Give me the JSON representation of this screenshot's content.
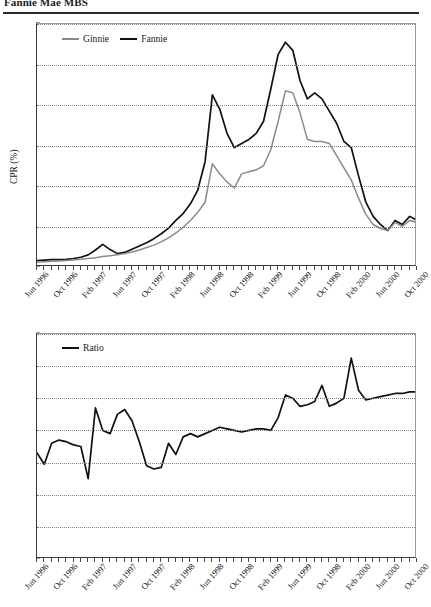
{
  "header": {
    "title": "Fannie Mae MBS"
  },
  "charts": [
    {
      "name": "cpr-chart",
      "legend": [
        {
          "label": "Ginnie",
          "color": "#8a8a8a"
        },
        {
          "label": "Fannie",
          "color": "#111111"
        }
      ],
      "ylabel": "CPR (%)",
      "yticks": [
        "0",
        "10",
        "20",
        "30",
        "40",
        "50",
        "60"
      ]
    },
    {
      "name": "ratio-chart",
      "legend": [
        {
          "label": "Ratio",
          "color": "#111111"
        }
      ],
      "ylabel": "",
      "yticks": [
        "0",
        "0.2",
        "0.4",
        "0.6",
        "0.8",
        "1.0",
        "1.2",
        "1.4"
      ]
    }
  ],
  "xlabels": [
    "Jun 1996",
    "Oct 1996",
    "Feb 1997",
    "Jun 1997",
    "Oct 1997",
    "Feb 1998",
    "Jun 1998",
    "Oct 1998",
    "Feb 1999",
    "Jun 1999",
    "Oct 1998",
    "Feb 2000",
    "Jun 2000",
    "Oct 2000"
  ],
  "chart_data": [
    {
      "type": "line",
      "name": "cpr-chart",
      "title": "",
      "xlabel": "",
      "ylabel": "CPR (%)",
      "ylim": [
        0,
        60
      ],
      "yticks": [
        0,
        10,
        20,
        30,
        40,
        50,
        60
      ],
      "grid": true,
      "legend_position": "top-left",
      "x": [
        "Jun 1996",
        "Jul 1996",
        "Aug 1996",
        "Sep 1996",
        "Oct 1996",
        "Nov 1996",
        "Dec 1996",
        "Jan 1997",
        "Feb 1997",
        "Mar 1997",
        "Apr 1997",
        "May 1997",
        "Jun 1997",
        "Jul 1997",
        "Aug 1997",
        "Sep 1997",
        "Oct 1997",
        "Nov 1997",
        "Dec 1997",
        "Jan 1998",
        "Feb 1998",
        "Mar 1998",
        "Apr 1998",
        "May 1998",
        "Jun 1998",
        "Jul 1998",
        "Aug 1998",
        "Sep 1998",
        "Oct 1998",
        "Nov 1998",
        "Dec 1998",
        "Jan 1999",
        "Feb 1999",
        "Mar 1999",
        "Apr 1999",
        "May 1999",
        "Jun 1999",
        "Jul 1999",
        "Aug 1999",
        "Sep 1999",
        "Oct 1999",
        "Nov 1999",
        "Dec 1999",
        "Jan 2000",
        "Feb 2000",
        "Mar 2000",
        "Apr 2000",
        "May 2000",
        "Jun 2000",
        "Jul 2000",
        "Aug 2000",
        "Sep 2000",
        "Oct 2000"
      ],
      "series": [
        {
          "name": "Fannie",
          "color": "#111111",
          "values": [
            1.6,
            1.7,
            1.8,
            1.8,
            1.9,
            2.1,
            2.4,
            3.0,
            4.2,
            5.6,
            4.3,
            3.3,
            3.6,
            4.4,
            5.2,
            6.0,
            7.0,
            8.2,
            9.6,
            11.5,
            13.2,
            15.6,
            19.0,
            26.0,
            42.5,
            39.0,
            33.0,
            29.5,
            30.5,
            31.5,
            33.0,
            36.0,
            44.0,
            52.5,
            55.5,
            53.5,
            46.0,
            41.5,
            43.0,
            41.5,
            38.5,
            35.5,
            31.0,
            29.5,
            22.5,
            16.0,
            12.5,
            10.5,
            9.0,
            11.5,
            10.5,
            12.5,
            11.5,
            12.0,
            12.0
          ]
        },
        {
          "name": "Ginnie",
          "color": "#8a8a8a",
          "values": [
            1.2,
            1.3,
            1.4,
            1.5,
            1.6,
            1.7,
            1.9,
            2.1,
            2.3,
            2.6,
            2.8,
            3.0,
            3.3,
            3.7,
            4.2,
            4.8,
            5.4,
            6.2,
            7.2,
            8.4,
            9.8,
            11.5,
            13.5,
            16.0,
            25.5,
            23.0,
            21.0,
            19.5,
            23.0,
            23.5,
            24.0,
            25.0,
            29.0,
            36.0,
            43.5,
            43.0,
            38.0,
            31.5,
            31.0,
            31.0,
            30.5,
            27.5,
            24.5,
            21.5,
            17.0,
            13.0,
            10.5,
            9.5,
            9.0,
            11.0,
            10.0,
            11.5,
            11.0,
            11.5,
            11.5
          ]
        }
      ]
    },
    {
      "type": "line",
      "name": "ratio-chart",
      "title": "",
      "xlabel": "",
      "ylabel": "",
      "ylim": [
        0,
        1.4
      ],
      "yticks": [
        0,
        0.2,
        0.4,
        0.6,
        0.8,
        1.0,
        1.2,
        1.4
      ],
      "grid": true,
      "legend_position": "top-left",
      "x": [
        "Jun 1996",
        "Jul 1996",
        "Aug 1996",
        "Sep 1996",
        "Oct 1996",
        "Nov 1996",
        "Dec 1996",
        "Jan 1997",
        "Feb 1997",
        "Mar 1997",
        "Apr 1997",
        "May 1997",
        "Jun 1997",
        "Jul 1997",
        "Aug 1997",
        "Sep 1997",
        "Oct 1997",
        "Nov 1997",
        "Dec 1997",
        "Jan 1998",
        "Feb 1998",
        "Mar 1998",
        "Apr 1998",
        "May 1998",
        "Jun 1998",
        "Jul 1998",
        "Aug 1998",
        "Sep 1998",
        "Oct 1998",
        "Nov 1998",
        "Dec 1998",
        "Jan 1999",
        "Feb 1999",
        "Mar 1999",
        "Apr 1999",
        "May 1999",
        "Jun 1999",
        "Jul 1999",
        "Aug 1999",
        "Sep 1999",
        "Oct 1999",
        "Nov 1999",
        "Dec 1999",
        "Jan 2000",
        "Feb 2000",
        "Mar 2000",
        "Apr 2000",
        "May 2000",
        "Jun 2000",
        "Jul 2000",
        "Aug 2000",
        "Sep 2000",
        "Oct 2000"
      ],
      "series": [
        {
          "name": "Ratio",
          "color": "#111111",
          "values": [
            0.66,
            0.59,
            0.72,
            0.74,
            0.73,
            0.71,
            0.7,
            0.5,
            0.94,
            0.8,
            0.78,
            0.9,
            0.93,
            0.86,
            0.73,
            0.58,
            0.56,
            0.57,
            0.72,
            0.65,
            0.76,
            0.78,
            0.76,
            0.78,
            0.8,
            0.82,
            0.81,
            0.8,
            0.79,
            0.8,
            0.81,
            0.81,
            0.8,
            0.88,
            1.02,
            1.0,
            0.95,
            0.96,
            0.98,
            1.08,
            0.95,
            0.97,
            1.0,
            1.25,
            1.05,
            0.99,
            1.0,
            1.01,
            1.02,
            1.03,
            1.03,
            1.04,
            1.04,
            1.04,
            1.04
          ]
        }
      ]
    }
  ]
}
